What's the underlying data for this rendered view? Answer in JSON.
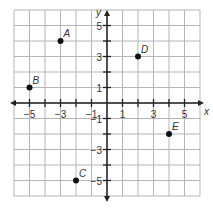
{
  "chart_data": {
    "type": "scatter",
    "title": "",
    "xlabel": "x",
    "ylabel": "y",
    "xlim": [
      -6,
      6
    ],
    "ylim": [
      -6,
      6
    ],
    "grid": true,
    "x_ticks": [
      -5,
      -3,
      -1,
      1,
      3,
      5
    ],
    "y_ticks": [
      5,
      3,
      1,
      -1,
      -3,
      -5
    ],
    "points": [
      {
        "label": "A",
        "x": -3,
        "y": 4
      },
      {
        "label": "B",
        "x": -5,
        "y": 1
      },
      {
        "label": "C",
        "x": -2,
        "y": -5
      },
      {
        "label": "D",
        "x": 2,
        "y": 3
      },
      {
        "label": "E",
        "x": 4,
        "y": -2
      }
    ]
  }
}
